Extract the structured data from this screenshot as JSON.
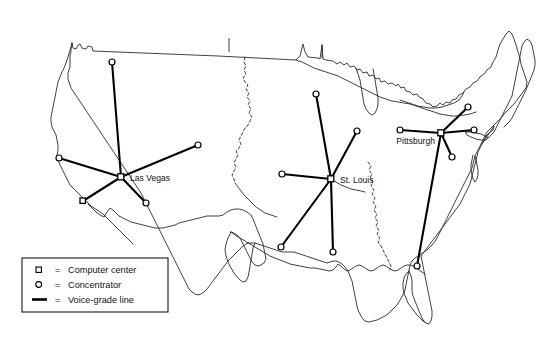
{
  "figure": {
    "background_color": "#ffffff",
    "ink_color": "#000000",
    "width": 547,
    "height": 346
  },
  "legend": {
    "box": {
      "x": 22,
      "y": 258,
      "width": 146,
      "height": 54
    },
    "entries": [
      {
        "symbol": "square-marker-icon",
        "equals": "=",
        "label": "Computer center"
      },
      {
        "symbol": "circle-marker-icon",
        "equals": "=",
        "label": "Concentrator"
      },
      {
        "symbol": "thick-line-icon",
        "equals": "=",
        "label": "Voice-grade line"
      }
    ]
  },
  "network": {
    "hubs": [
      {
        "id": "las-vegas",
        "label": "Las Vegas",
        "type": "Computer center",
        "x": 121,
        "y": 177,
        "label_x": 130,
        "label_y": 181,
        "label_anchor": "start",
        "concentrators": [
          {
            "x": 112,
            "y": 62
          },
          {
            "x": 198,
            "y": 145
          },
          {
            "x": 59,
            "y": 158
          },
          {
            "x": 83,
            "y": 201
          },
          {
            "x": 146,
            "y": 203
          }
        ]
      },
      {
        "id": "st-louis",
        "label": "St. Louis",
        "type": "Computer center",
        "x": 331,
        "y": 179,
        "label_x": 340,
        "label_y": 183,
        "label_anchor": "start",
        "concentrators": [
          {
            "x": 316,
            "y": 94
          },
          {
            "x": 357,
            "y": 131
          },
          {
            "x": 282,
            "y": 174
          },
          {
            "x": 281,
            "y": 247
          },
          {
            "x": 333,
            "y": 252
          }
        ]
      },
      {
        "id": "pittsburgh",
        "label": "Pittsburgh",
        "type": "Computer center",
        "x": 441,
        "y": 133,
        "label_x": 437,
        "label_y": 144,
        "label_anchor": "end",
        "concentrators": [
          {
            "x": 400,
            "y": 130
          },
          {
            "x": 468,
            "y": 107
          },
          {
            "x": 474,
            "y": 130
          },
          {
            "x": 452,
            "y": 157
          },
          {
            "x": 417,
            "y": 266
          }
        ]
      }
    ]
  },
  "geography": {
    "outline_name": "continental-united-states",
    "river_name": "mississippi-missouri-river"
  }
}
